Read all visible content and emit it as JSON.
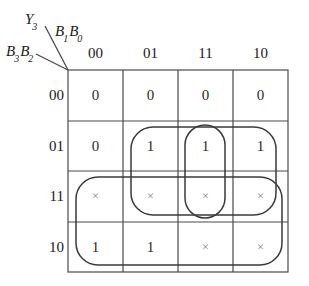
{
  "diagram": {
    "type": "karnaugh-map",
    "title_labels": {
      "output": "Y",
      "output_sub": "3",
      "col_var_a": "B",
      "col_var_a_sub": "1",
      "col_var_b": "B",
      "col_var_b_sub": "0",
      "row_var_a": "B",
      "row_var_a_sub": "3",
      "row_var_b": "B",
      "row_var_b_sub": "2"
    },
    "column_headers": [
      "00",
      "01",
      "11",
      "10"
    ],
    "row_headers": [
      "00",
      "01",
      "11",
      "10"
    ],
    "cells": [
      [
        "0",
        "0",
        "0",
        "0"
      ],
      [
        "0",
        "1",
        "1",
        "1"
      ],
      [
        "×",
        "×",
        "×",
        "×"
      ],
      [
        "1",
        "1",
        "×",
        "×"
      ]
    ],
    "colors": {
      "grid_line": "#4a4a4a",
      "group_outline": "#3a3a3a",
      "value_text": "#2b2b2b",
      "dontcare_text": "#8a8a8a",
      "background": "#ffffff"
    },
    "groups": [
      {
        "name": "group-col-11-vertical",
        "cells": "rows 01-11, column 11"
      },
      {
        "name": "group-mid-wide",
        "cells": "rows 01-11, columns 01-10"
      },
      {
        "name": "group-bottom-wide",
        "cells": "rows 11-10, all columns"
      },
      {
        "name": "group-left-tall",
        "cells": "rows 11-10, column 00"
      }
    ]
  }
}
